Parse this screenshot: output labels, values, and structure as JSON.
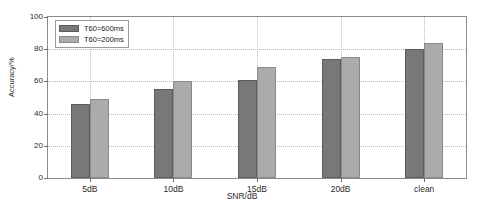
{
  "chart_data": {
    "type": "bar",
    "title": "",
    "xlabel": "SNR/dB",
    "ylabel": "Accuracy/%",
    "categories": [
      "5dB",
      "10dB",
      "15dB",
      "20dB",
      "clean"
    ],
    "series": [
      {
        "name": "T60=600ms",
        "color": "#787878",
        "values": [
          46,
          55,
          61,
          74,
          80
        ]
      },
      {
        "name": "T60=200ms",
        "color": "#ababab",
        "values": [
          49,
          60,
          69,
          75,
          84
        ]
      }
    ],
    "ylim": [
      0,
      100
    ],
    "yticks": [
      0,
      20,
      40,
      60,
      80,
      100
    ],
    "ytick_labels": [
      "0",
      "20",
      "40",
      "60",
      "80",
      "100"
    ],
    "grid": true,
    "legend_position": "upper left"
  }
}
